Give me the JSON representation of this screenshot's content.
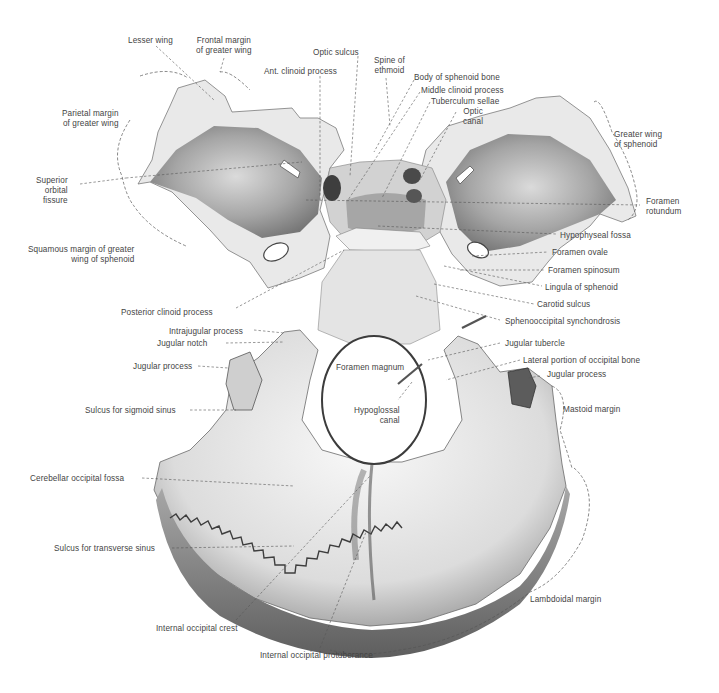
{
  "figure": {
    "colors": {
      "background": "#ffffff",
      "bone_light": "#f2f2f2",
      "bone_mid": "#b9b9b9",
      "bone_dark": "#6e6e6e",
      "leader": "#555555",
      "text": "#444444"
    }
  },
  "labels": [
    {
      "id": "lesser-wing",
      "lines": [
        "Lesser wing"
      ],
      "x": 128,
      "y": 36,
      "align": "l"
    },
    {
      "id": "frontal-margin-greater-wing",
      "lines": [
        "Frontal margin",
        "of greater wing"
      ],
      "x": 204,
      "y": 36,
      "align": "c"
    },
    {
      "id": "optic-sulcus",
      "lines": [
        "Optic sulcus"
      ],
      "x": 313,
      "y": 48,
      "align": "l"
    },
    {
      "id": "ant-clinoid-process",
      "lines": [
        "Ant. clinoid process"
      ],
      "x": 264,
      "y": 67,
      "align": "l"
    },
    {
      "id": "spine-of-ethmoid",
      "lines": [
        "Spine of",
        "ethmoid"
      ],
      "x": 375,
      "y": 56,
      "align": "c"
    },
    {
      "id": "body-of-sphenoid-bone",
      "lines": [
        "Body of sphenoid bone"
      ],
      "x": 414,
      "y": 73,
      "align": "l"
    },
    {
      "id": "middle-clinoid-process",
      "lines": [
        "Middle clinoid process"
      ],
      "x": 421,
      "y": 86,
      "align": "l"
    },
    {
      "id": "tuberculum-sellae",
      "lines": [
        "Tuberculum sellae"
      ],
      "x": 431,
      "y": 97,
      "align": "l"
    },
    {
      "id": "optic-canal",
      "lines": [
        "Optic",
        "canal"
      ],
      "x": 469,
      "y": 107,
      "align": "c"
    },
    {
      "id": "parietal-margin-greater-wing",
      "lines": [
        "Parietal margin",
        "of greater wing"
      ],
      "x": 62,
      "y": 109,
      "align": "r",
      "right": 127
    },
    {
      "id": "greater-wing-of-sphenoid",
      "lines": [
        "Greater wing",
        "of sphenoid"
      ],
      "x": 614,
      "y": 130,
      "align": "l"
    },
    {
      "id": "superior-orbital-fissure",
      "lines": [
        "Superior",
        "orbital",
        "fissure"
      ],
      "x": 36,
      "y": 176,
      "align": "r",
      "right": 78
    },
    {
      "id": "foramen-rotundum",
      "lines": [
        "Foramen",
        "rotundum"
      ],
      "x": 646,
      "y": 197,
      "align": "l"
    },
    {
      "id": "hypophyseal-fossa",
      "lines": [
        "Hypophyseal fossa"
      ],
      "x": 560,
      "y": 231,
      "align": "l"
    },
    {
      "id": "squamous-margin-greater-wing",
      "lines": [
        "Squamous margin of greater",
        "wing of sphenoid"
      ],
      "x": 28,
      "y": 245,
      "align": "r",
      "right": 146
    },
    {
      "id": "foramen-ovale",
      "lines": [
        "Foramen ovale"
      ],
      "x": 552,
      "y": 248,
      "align": "l"
    },
    {
      "id": "foramen-spinosum",
      "lines": [
        "Foramen spinosum"
      ],
      "x": 548,
      "y": 266,
      "align": "l"
    },
    {
      "id": "lingula-of-sphenoid",
      "lines": [
        "Lingula of sphenoid"
      ],
      "x": 545,
      "y": 283,
      "align": "l"
    },
    {
      "id": "posterior-clinoid-process",
      "lines": [
        "Posterior clinoid process"
      ],
      "x": 121,
      "y": 308,
      "align": "l"
    },
    {
      "id": "carotid-sulcus",
      "lines": [
        "Carotid sulcus"
      ],
      "x": 537,
      "y": 300,
      "align": "l"
    },
    {
      "id": "sphenooccipital-synchondrosis",
      "lines": [
        "Sphenooccipital synchondrosis"
      ],
      "x": 505,
      "y": 317,
      "align": "l"
    },
    {
      "id": "intrajugular-process",
      "lines": [
        "Intrajugular process"
      ],
      "x": 169,
      "y": 327,
      "align": "l"
    },
    {
      "id": "jugular-notch",
      "lines": [
        "Jugular notch"
      ],
      "x": 157,
      "y": 339,
      "align": "l"
    },
    {
      "id": "jugular-tubercle",
      "lines": [
        "Jugular tubercle"
      ],
      "x": 505,
      "y": 339,
      "align": "l"
    },
    {
      "id": "lateral-portion-occipital-bone",
      "lines": [
        "Lateral portion of occipital bone"
      ],
      "x": 523,
      "y": 356,
      "align": "l"
    },
    {
      "id": "foramen-magnum",
      "lines": [
        "Foramen magnum"
      ],
      "x": 336,
      "y": 363,
      "align": "l"
    },
    {
      "id": "jugular-process-left",
      "lines": [
        "Jugular process"
      ],
      "x": 133,
      "y": 362,
      "align": "l"
    },
    {
      "id": "jugular-process-right",
      "lines": [
        "Jugular process"
      ],
      "x": 547,
      "y": 370,
      "align": "l"
    },
    {
      "id": "hypoglossal-canal",
      "lines": [
        "Hypoglossal",
        "canal"
      ],
      "x": 354,
      "y": 406,
      "align": "r",
      "right": 406
    },
    {
      "id": "mastoid-margin",
      "lines": [
        "Mastoid margin"
      ],
      "x": 563,
      "y": 405,
      "align": "l"
    },
    {
      "id": "sulcus-sigmoid-sinus",
      "lines": [
        "Sulcus for sigmoid sinus"
      ],
      "x": 85,
      "y": 406,
      "align": "l"
    },
    {
      "id": "cerebellar-occipital-fossa",
      "lines": [
        "Cerebellar occipital fossa"
      ],
      "x": 30,
      "y": 474,
      "align": "l"
    },
    {
      "id": "sulcus-transverse-sinus",
      "lines": [
        "Sulcus for transverse sinus"
      ],
      "x": 54,
      "y": 544,
      "align": "l"
    },
    {
      "id": "lambdoidal-margin",
      "lines": [
        "Lambdoidal margin"
      ],
      "x": 530,
      "y": 595,
      "align": "l"
    },
    {
      "id": "internal-occipital-crest",
      "lines": [
        "Internal occipital crest"
      ],
      "x": 156,
      "y": 624,
      "align": "l"
    },
    {
      "id": "internal-occipital-protuberance",
      "lines": [
        "Internal occipital protuberance"
      ],
      "x": 260,
      "y": 651,
      "align": "l"
    }
  ]
}
